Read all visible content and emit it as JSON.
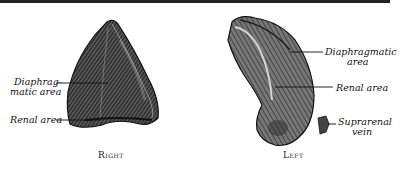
{
  "figure": {
    "left_panel": {
      "caption": "Right",
      "labels": {
        "diaphragmatic_line1": "Diaphrag-",
        "diaphragmatic_line2": "matic area",
        "renal": "Renal area"
      }
    },
    "right_panel": {
      "caption": "Left",
      "labels": {
        "diaphragmatic_line1": "Diaphragmatic",
        "diaphragmatic_line2": "area",
        "renal": "Renal area",
        "vein_line1": "Suprarenal",
        "vein_line2": "vein"
      }
    },
    "colors": {
      "ink": "#1a1a1a",
      "paper": "#ffffff"
    }
  }
}
